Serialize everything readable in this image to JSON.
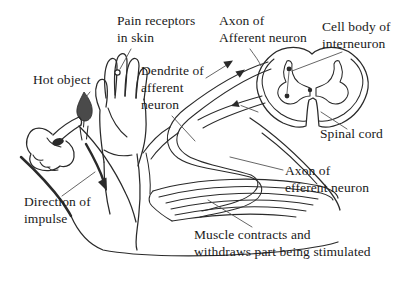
{
  "figure": {
    "background": "#ffffff",
    "ink_color": "#2a2a2a",
    "flame_color": "#4a4a4a",
    "leader_color": "#555555"
  },
  "labels": {
    "hot_object": "Hot object",
    "pain_receptors": "Pain receptors\nin skin",
    "axon_afferent": "Axon of\nAfferent neuron",
    "cell_body_interneuron": "Cell body of\ninterneuron",
    "dendrite_afferent": "Dendrite of\nafferent\nneuron",
    "spinal_cord": "Spinal cord",
    "axon_efferent": "Axon of\nefferent neuron",
    "direction_of_impulse": "Direction of\nimpulse",
    "muscle_contracts": "Muscle contracts and\nwithdraws part being stimulated"
  }
}
